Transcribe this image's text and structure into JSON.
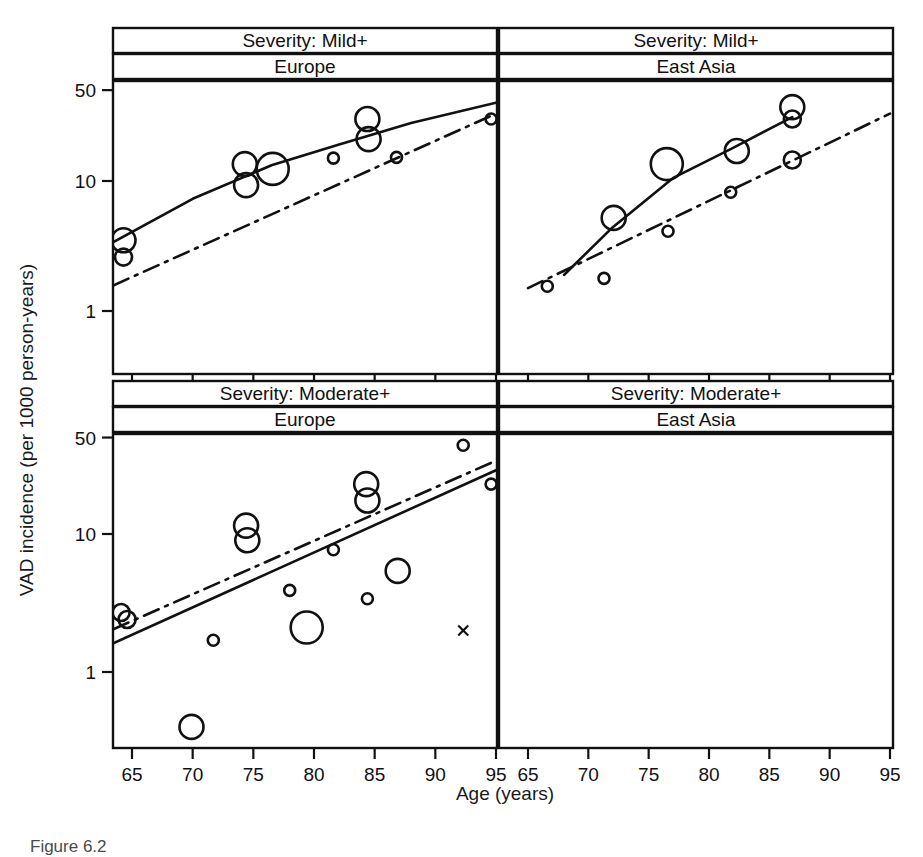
{
  "figure": {
    "caption": "Figure 6.2",
    "y_axis_label": "VAD incidence (per 1000 person-years)",
    "x_axis_label": "Age (years)"
  },
  "chart_data": {
    "type": "scatter",
    "title": "",
    "xlabel": "Age (years)",
    "ylabel": "VAD incidence (per 1000 person-years)",
    "xlim": [
      63,
      96
    ],
    "ylim": [
      0.3,
      70
    ],
    "yscale": "log",
    "xscale": "linear",
    "grid": false,
    "legend": "none",
    "x_ticks": [
      65,
      70,
      75,
      80,
      85,
      90,
      95
    ],
    "y_ticks": [
      1,
      10,
      50
    ],
    "y_tick_labels": [
      "1",
      "10",
      "50"
    ],
    "marker_note": "open circles sized by study weight; small x = single uncertain estimate",
    "line_styles": {
      "solid": "fitted pooled incidence curve",
      "dash_dot": "reference / comparison trend"
    },
    "panels": [
      {
        "row": 0,
        "col": 0,
        "strip_top": "Severity: Mild+",
        "strip_bottom": "Europe",
        "points": [
          {
            "age": 64.3,
            "incidence": 3.5,
            "size": "large"
          },
          {
            "age": 64.3,
            "incidence": 2.6,
            "size": "medium"
          },
          {
            "age": 74.3,
            "incidence": 13.5,
            "size": "large"
          },
          {
            "age": 74.4,
            "incidence": 9.3,
            "size": "large"
          },
          {
            "age": 76.6,
            "incidence": 12.4,
            "size": "xlarge"
          },
          {
            "age": 81.6,
            "incidence": 15.0,
            "size": "small"
          },
          {
            "age": 84.4,
            "incidence": 30.0,
            "size": "large"
          },
          {
            "age": 84.5,
            "incidence": 21.0,
            "size": "large"
          },
          {
            "age": 86.8,
            "incidence": 15.2,
            "size": "small"
          },
          {
            "age": 94.6,
            "incidence": 30.0,
            "size": "small"
          }
        ],
        "solid_line": [
          {
            "age": 63.5,
            "incidence": 3.4
          },
          {
            "age": 70.0,
            "incidence": 7.3
          },
          {
            "age": 76.5,
            "incidence": 13.2
          },
          {
            "age": 82.0,
            "incidence": 19.0
          },
          {
            "age": 88.0,
            "incidence": 28.0
          },
          {
            "age": 95.0,
            "incidence": 40.0
          }
        ],
        "dashdot_line": [
          {
            "age": 63.5,
            "incidence": 1.58
          },
          {
            "age": 95.0,
            "incidence": 33.0
          }
        ]
      },
      {
        "row": 0,
        "col": 1,
        "strip_top": "Severity: Mild+",
        "strip_bottom": "East Asia",
        "points": [
          {
            "age": 66.6,
            "incidence": 1.55,
            "size": "small"
          },
          {
            "age": 71.3,
            "incidence": 1.78,
            "size": "small"
          },
          {
            "age": 72.1,
            "incidence": 5.2,
            "size": "large"
          },
          {
            "age": 76.5,
            "incidence": 13.5,
            "size": "xlarge"
          },
          {
            "age": 76.6,
            "incidence": 4.1,
            "size": "small"
          },
          {
            "age": 81.8,
            "incidence": 8.2,
            "size": "small"
          },
          {
            "age": 82.3,
            "incidence": 17.0,
            "size": "large"
          },
          {
            "age": 86.9,
            "incidence": 37.0,
            "size": "large"
          },
          {
            "age": 86.9,
            "incidence": 30.0,
            "size": "medium"
          },
          {
            "age": 86.9,
            "incidence": 14.5,
            "size": "medium"
          }
        ],
        "solid_line": [
          {
            "age": 68.0,
            "incidence": 1.9
          },
          {
            "age": 72.0,
            "incidence": 4.4
          },
          {
            "age": 77.0,
            "incidence": 10.5
          },
          {
            "age": 82.0,
            "incidence": 18.0
          },
          {
            "age": 86.9,
            "incidence": 31.0
          }
        ],
        "dashdot_line": [
          {
            "age": 65.0,
            "incidence": 1.5
          },
          {
            "age": 95.0,
            "incidence": 33.0
          }
        ]
      },
      {
        "row": 1,
        "col": 0,
        "strip_top": "Severity: Moderate+",
        "strip_bottom": "Europe",
        "points": [
          {
            "age": 64.1,
            "incidence": 2.7,
            "size": "medium"
          },
          {
            "age": 64.6,
            "incidence": 2.4,
            "size": "medium"
          },
          {
            "age": 69.9,
            "incidence": 0.4,
            "size": "large"
          },
          {
            "age": 71.7,
            "incidence": 1.7,
            "size": "small"
          },
          {
            "age": 74.4,
            "incidence": 11.5,
            "size": "large"
          },
          {
            "age": 74.5,
            "incidence": 9.0,
            "size": "large"
          },
          {
            "age": 78.0,
            "incidence": 3.9,
            "size": "small"
          },
          {
            "age": 79.4,
            "incidence": 2.1,
            "size": "xlarge"
          },
          {
            "age": 81.6,
            "incidence": 7.7,
            "size": "small"
          },
          {
            "age": 84.3,
            "incidence": 23.0,
            "size": "large"
          },
          {
            "age": 84.4,
            "incidence": 17.5,
            "size": "large"
          },
          {
            "age": 84.4,
            "incidence": 3.4,
            "size": "small"
          },
          {
            "age": 86.9,
            "incidence": 5.4,
            "size": "large"
          },
          {
            "age": 92.3,
            "incidence": 44.0,
            "size": "small"
          },
          {
            "age": 92.3,
            "incidence": 2.0,
            "size": "xmark"
          },
          {
            "age": 94.6,
            "incidence": 23.0,
            "size": "small"
          }
        ],
        "solid_line": [
          {
            "age": 63.5,
            "incidence": 1.62
          },
          {
            "age": 95.0,
            "incidence": 29.0
          }
        ],
        "dashdot_line": [
          {
            "age": 63.5,
            "incidence": 2.05
          },
          {
            "age": 95.0,
            "incidence": 34.0
          }
        ]
      },
      {
        "row": 1,
        "col": 1,
        "strip_top": "Severity: Moderate+",
        "strip_bottom": "East Asia",
        "points": [],
        "solid_line": [],
        "dashdot_line": []
      }
    ]
  }
}
